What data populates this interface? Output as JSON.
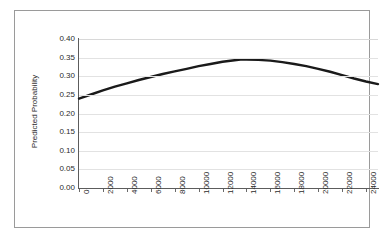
{
  "chart_data": {
    "type": "line",
    "title": "",
    "xlabel": "",
    "ylabel": "Predicted Probability",
    "xlim": [
      0,
      25000
    ],
    "ylim": [
      0.0,
      0.4
    ],
    "grid": true,
    "legend": false,
    "xticks": [
      "0",
      "2000",
      "4000",
      "6000",
      "8000",
      "10000",
      "12000",
      "14000",
      "16000",
      "18000",
      "20000",
      "22000",
      "24000"
    ],
    "xtick_values": [
      0,
      2000,
      4000,
      6000,
      8000,
      10000,
      12000,
      14000,
      16000,
      18000,
      20000,
      22000,
      24000
    ],
    "yticks": [
      "0.00",
      "0.05",
      "0.10",
      "0.15",
      "0.20",
      "0.25",
      "0.30",
      "0.35",
      "0.40"
    ],
    "ytick_values": [
      0.0,
      0.05,
      0.1,
      0.15,
      0.2,
      0.25,
      0.3,
      0.35,
      0.4
    ],
    "series": [
      {
        "name": "Predicted Probability",
        "color": "#1a1a1a",
        "line_width": 2.4,
        "x": [
          0,
          1000,
          2000,
          3000,
          4000,
          5000,
          6000,
          7000,
          8000,
          9000,
          10000,
          11000,
          12000,
          13000,
          13500,
          14000,
          15000,
          16000,
          17000,
          18000,
          19000,
          20000,
          21000,
          22000,
          23000,
          24000,
          25000
        ],
        "y": [
          0.24,
          0.251,
          0.262,
          0.272,
          0.281,
          0.29,
          0.298,
          0.306,
          0.313,
          0.32,
          0.327,
          0.333,
          0.339,
          0.343,
          0.345,
          0.345,
          0.344,
          0.342,
          0.338,
          0.333,
          0.327,
          0.32,
          0.312,
          0.303,
          0.294,
          0.286,
          0.279
        ]
      }
    ]
  },
  "axes": {
    "ylabel_text": "Predicted Probability"
  }
}
